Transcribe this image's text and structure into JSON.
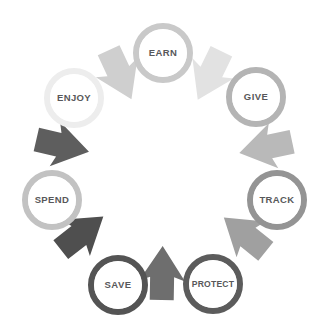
{
  "diagram": {
    "type": "circular-process-cycle",
    "background_color": "#ffffff",
    "label_color": "#58585a",
    "direction": "clockwise",
    "node_count": 7,
    "nodes": [
      {
        "id": "earn",
        "label": "EARN",
        "order": 1,
        "ring_color": "#c9c9c9",
        "fill_color": "#ffffff",
        "cx": 163,
        "cy": 53,
        "r": 27
      },
      {
        "id": "give",
        "label": "GIVE",
        "order": 2,
        "ring_color": "#b4b4b4",
        "fill_color": "#ffffff",
        "cx": 256,
        "cy": 97,
        "r": 27
      },
      {
        "id": "track",
        "label": "TRACK",
        "order": 3,
        "ring_color": "#949494",
        "fill_color": "#ffffff",
        "cx": 277,
        "cy": 200,
        "r": 27
      },
      {
        "id": "protect",
        "label": "PROTECT",
        "order": 4,
        "ring_color": "#5c5c5c",
        "fill_color": "#ffffff",
        "cx": 213,
        "cy": 284,
        "r": 27
      },
      {
        "id": "save",
        "label": "SAVE",
        "order": 5,
        "ring_color": "#545454",
        "fill_color": "#ffffff",
        "cx": 118,
        "cy": 285,
        "r": 27
      },
      {
        "id": "spend",
        "label": "SPEND",
        "order": 6,
        "ring_color": "#c2c2c2",
        "fill_color": "#ffffff",
        "cx": 52,
        "cy": 200,
        "r": 27
      },
      {
        "id": "enjoy",
        "label": "ENJOY",
        "order": 7,
        "ring_color": "#ededed",
        "fill_color": "#ffffff",
        "cx": 74,
        "cy": 98,
        "r": 27
      }
    ],
    "arrows": [
      {
        "id": "arrow-enjoy-earn",
        "from": "enjoy",
        "to": "earn",
        "color": "#e2e2e2",
        "angle": 296
      },
      {
        "id": "arrow-earn-give",
        "from": "earn",
        "to": "give",
        "color": "#b9b9b9",
        "angle": 348
      },
      {
        "id": "arrow-give-track",
        "from": "give",
        "to": "track",
        "color": "#a0a0a0",
        "angle": 39
      },
      {
        "id": "arrow-track-protect",
        "from": "track",
        "to": "protect",
        "color": "#6e6e6e",
        "angle": 91
      },
      {
        "id": "arrow-protect-save",
        "from": "protect",
        "to": "save",
        "color": "#4f4f4f",
        "angle": 142
      },
      {
        "id": "arrow-save-spend",
        "from": "save",
        "to": "spend",
        "color": "#5e5e5e",
        "angle": 193
      },
      {
        "id": "arrow-spend-enjoy",
        "from": "spend",
        "to": "enjoy",
        "color": "#cfcfcf",
        "angle": 245
      }
    ]
  }
}
